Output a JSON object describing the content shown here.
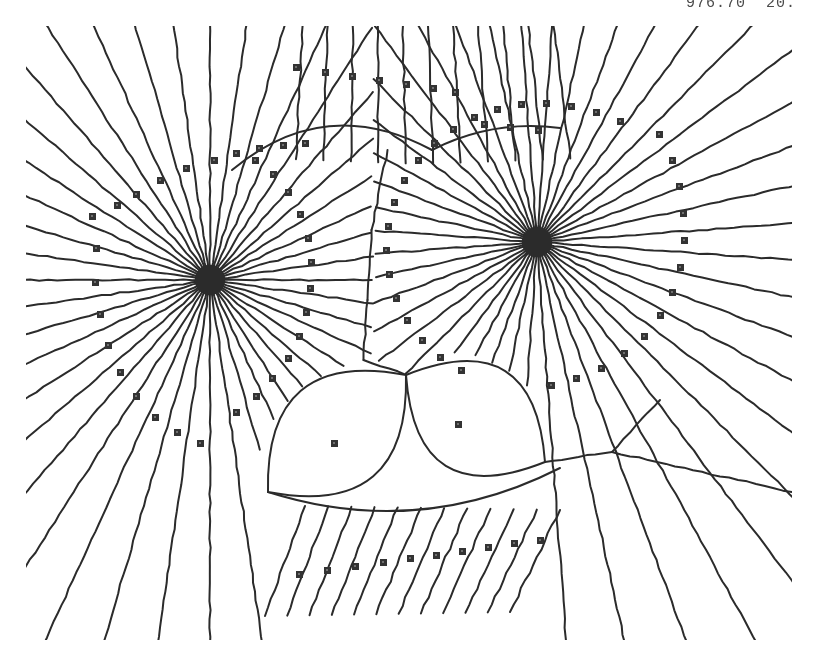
{
  "figure": {
    "kind": "voronoi-diagram",
    "caption_fragment": "976.70  20.",
    "background_color": "#ffffff",
    "edge_color": "#2b2b2b",
    "site_color": "#333333",
    "edge_width": 2,
    "site_size": 7,
    "canvas": {
      "width": 821,
      "height": 669
    },
    "plot_area": {
      "left": 26,
      "top": 26,
      "right": 792,
      "bottom": 640
    }
  },
  "chart_data": {
    "type": "scatter",
    "title": "",
    "xlabel": "",
    "ylabel": "",
    "xlim": [
      0,
      821
    ],
    "ylim": [
      669,
      0
    ],
    "grid": false,
    "legend": "none",
    "annotations": [
      "976.70",
      "20."
    ],
    "clusters": [
      {
        "name": "left-cluster",
        "cx": 210,
        "cy": 280,
        "radius": 150,
        "ray_count": 44,
        "angle_start": 0,
        "core_radius": 16
      },
      {
        "name": "right-cluster",
        "cx": 537,
        "cy": 242,
        "radius": 150,
        "ray_count": 44,
        "angle_start": 4,
        "core_radius": 16
      }
    ],
    "lens_cells": [
      {
        "name": "left-lens",
        "site_x": 334,
        "site_y": 443,
        "x1": 268,
        "y1": 492,
        "x2": 406,
        "y2": 375,
        "bulge": 56
      },
      {
        "name": "right-lens",
        "site_x": 458,
        "site_y": 424,
        "x1": 406,
        "y1": 375,
        "x2": 545,
        "y2": 462,
        "bulge": 56
      }
    ],
    "top_fan": {
      "y_top": 26,
      "y_base": 150,
      "x_from": 300,
      "x_to": 560,
      "count": 11
    },
    "bottom_fan": {
      "y_top": 500,
      "y_base": 640,
      "x_from": 305,
      "x_to": 560,
      "count": 12
    },
    "series": [
      {
        "name": "sites-left-ring",
        "marker": "square",
        "points": [
          [
            92,
            216
          ],
          [
            96,
            248
          ],
          [
            95,
            282
          ],
          [
            100,
            314
          ],
          [
            108,
            345
          ],
          [
            120,
            372
          ],
          [
            136,
            396
          ],
          [
            155,
            417
          ],
          [
            177,
            432
          ],
          [
            200,
            443
          ],
          [
            214,
            160
          ],
          [
            186,
            168
          ],
          [
            160,
            180
          ],
          [
            136,
            194
          ],
          [
            117,
            205
          ],
          [
            236,
            153
          ],
          [
            259,
            148
          ],
          [
            283,
            145
          ],
          [
            305,
            143
          ],
          [
            236,
            412
          ],
          [
            256,
            396
          ],
          [
            272,
            378
          ],
          [
            288,
            358
          ],
          [
            299,
            336
          ],
          [
            306,
            312
          ],
          [
            310,
            288
          ],
          [
            311,
            262
          ],
          [
            308,
            238
          ],
          [
            300,
            214
          ],
          [
            288,
            192
          ],
          [
            273,
            174
          ],
          [
            255,
            160
          ]
        ]
      },
      {
        "name": "sites-right-ring",
        "marker": "square",
        "points": [
          [
            659,
            134
          ],
          [
            672,
            160
          ],
          [
            679,
            186
          ],
          [
            683,
            213
          ],
          [
            684,
            240
          ],
          [
            680,
            267
          ],
          [
            672,
            292
          ],
          [
            660,
            315
          ],
          [
            644,
            336
          ],
          [
            624,
            353
          ],
          [
            601,
            368
          ],
          [
            576,
            378
          ],
          [
            551,
            385
          ],
          [
            620,
            121
          ],
          [
            596,
            112
          ],
          [
            571,
            106
          ],
          [
            546,
            103
          ],
          [
            521,
            104
          ],
          [
            497,
            109
          ],
          [
            474,
            117
          ],
          [
            453,
            129
          ],
          [
            434,
            143
          ],
          [
            418,
            160
          ],
          [
            404,
            180
          ],
          [
            394,
            202
          ],
          [
            388,
            226
          ],
          [
            386,
            250
          ],
          [
            389,
            274
          ],
          [
            396,
            298
          ],
          [
            407,
            320
          ],
          [
            422,
            340
          ],
          [
            440,
            357
          ],
          [
            461,
            370
          ]
        ]
      },
      {
        "name": "sites-top-row",
        "marker": "square",
        "points": [
          [
            296,
            67
          ],
          [
            325,
            72
          ],
          [
            352,
            76
          ],
          [
            379,
            80
          ],
          [
            406,
            84
          ],
          [
            433,
            88
          ],
          [
            455,
            92
          ],
          [
            484,
            124
          ],
          [
            510,
            127
          ],
          [
            538,
            130
          ]
        ]
      },
      {
        "name": "sites-bottom-row",
        "marker": "square",
        "points": [
          [
            299,
            574
          ],
          [
            327,
            570
          ],
          [
            355,
            566
          ],
          [
            383,
            562
          ],
          [
            410,
            558
          ],
          [
            436,
            555
          ],
          [
            462,
            551
          ],
          [
            488,
            547
          ],
          [
            514,
            543
          ],
          [
            540,
            540
          ]
        ]
      },
      {
        "name": "sites-lens",
        "marker": "square",
        "points": [
          [
            334,
            443
          ],
          [
            458,
            424
          ]
        ]
      }
    ]
  }
}
